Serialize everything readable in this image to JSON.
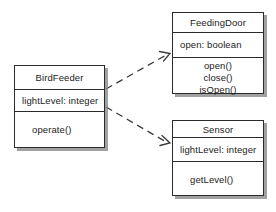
{
  "diagram": {
    "type": "uml-class-diagram",
    "background_color": "#ffffff",
    "line_color": "#2b2b2b",
    "shadow_color": "#828282",
    "classes": [
      {
        "id": "birdfeeder",
        "name": "BirdFeeder",
        "attributes": [
          "lightLevel: integer"
        ],
        "operations": [
          "operate()"
        ]
      },
      {
        "id": "feedingdoor",
        "name": "FeedingDoor",
        "attributes": [
          "open: boolean"
        ],
        "operations": [
          "open()",
          "close()",
          "isOpen()"
        ]
      },
      {
        "id": "sensor",
        "name": "Sensor",
        "attributes": [
          "lightLevel: integer"
        ],
        "operations": [
          "getLevel()"
        ]
      }
    ],
    "relationships": [
      {
        "id": "birdfeeder-to-feedingdoor",
        "kind": "dependency",
        "style": "dashed-open-arrow",
        "source": "BirdFeeder",
        "target": "FeedingDoor",
        "label": ""
      },
      {
        "id": "birdfeeder-to-sensor",
        "kind": "dependency",
        "style": "dashed-open-arrow",
        "source": "BirdFeeder",
        "target": "Sensor",
        "label": ""
      }
    ]
  }
}
